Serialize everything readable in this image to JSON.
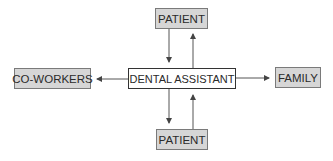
{
  "diagram": {
    "type": "communication-flow",
    "nodes": {
      "center": {
        "label": "DENTAL ASSISTANT"
      },
      "top": {
        "label": "PATIENT"
      },
      "bottom": {
        "label": "PATIENT"
      },
      "left": {
        "label": "CO-WORKERS"
      },
      "right": {
        "label": "FAMILY"
      }
    },
    "edges": [
      {
        "from": "PATIENT (top)",
        "to": "DENTAL ASSISTANT"
      },
      {
        "from": "DENTAL ASSISTANT",
        "to": "PATIENT (top)"
      },
      {
        "from": "DENTAL ASSISTANT",
        "to": "PATIENT (bottom)"
      },
      {
        "from": "PATIENT (bottom)",
        "to": "DENTAL ASSISTANT"
      },
      {
        "from": "DENTAL ASSISTANT",
        "to": "CO-WORKERS"
      },
      {
        "from": "DENTAL ASSISTANT",
        "to": "FAMILY"
      }
    ],
    "colors": {
      "shaded_fill": "#d6d6d6",
      "center_fill": "#ffffff",
      "line": "#555555"
    }
  }
}
